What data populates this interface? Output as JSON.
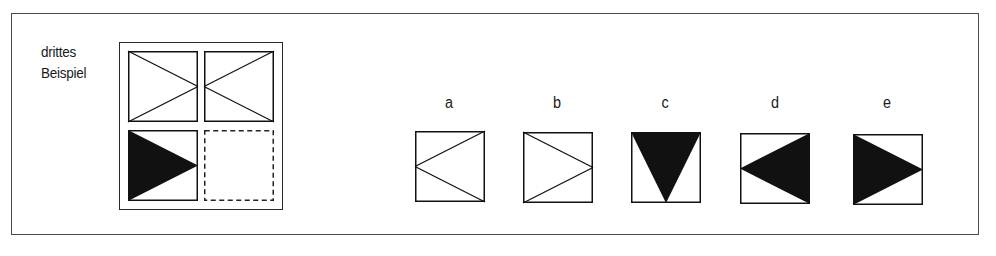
{
  "example_label": {
    "line1": "drittes",
    "line2": "Beispiel"
  },
  "matrix": {
    "cells": [
      {
        "position": "top-left",
        "figure": "crossed-lines-meeting-right",
        "filled": false
      },
      {
        "position": "top-right",
        "figure": "crossed-lines-meeting-left",
        "filled": false
      },
      {
        "position": "bottom-left",
        "figure": "triangle-pointing-right",
        "filled": true
      },
      {
        "position": "bottom-right",
        "figure": "empty-dashed-placeholder",
        "filled": false
      }
    ]
  },
  "options": [
    {
      "label": "a",
      "figure": "triangle-outline-pointing-left",
      "filled": false
    },
    {
      "label": "b",
      "figure": "triangle-outline-pointing-right",
      "filled": false
    },
    {
      "label": "c",
      "figure": "triangle-pointing-down",
      "filled": true
    },
    {
      "label": "d",
      "figure": "triangle-pointing-left",
      "filled": true
    },
    {
      "label": "e",
      "figure": "triangle-pointing-right",
      "filled": true
    }
  ],
  "colors": {
    "ink": "#111111",
    "frame": "#4a4a4a",
    "background": "#ffffff"
  },
  "footer": {
    "text": ""
  }
}
